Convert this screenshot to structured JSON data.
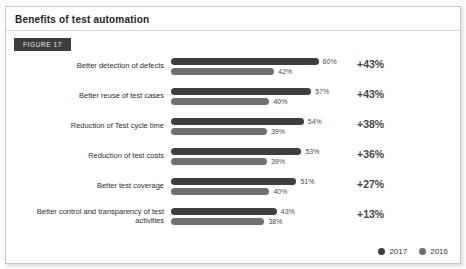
{
  "header": {
    "title": "Benefits of test automation",
    "figure_label": "FIGURE 17"
  },
  "chart_data": {
    "type": "bar",
    "orientation": "horizontal",
    "title": "Benefits of test automation",
    "unit": "%",
    "xlim": [
      0,
      65
    ],
    "grid": false,
    "legend_position": "bottom-right",
    "categories": [
      "Better detection of defects",
      "Better reuse of test cases",
      "Reduction of Test cycle time",
      "Reduction of test costs",
      "Better test coverage",
      "Better control and transparency of test activities"
    ],
    "series": [
      {
        "name": "2017",
        "color": "#3e3e3e",
        "values": [
          60,
          57,
          54,
          53,
          51,
          43
        ]
      },
      {
        "name": "2016",
        "color": "#6f6f6f",
        "values": [
          42,
          40,
          39,
          39,
          40,
          38
        ]
      }
    ],
    "change_labels": [
      "+43%",
      "+43%",
      "+38%",
      "+36%",
      "+27%",
      "+13%"
    ]
  },
  "rows": [
    {
      "v2017": "60%",
      "v2016": "42%",
      "change": "+43%"
    },
    {
      "v2017": "57%",
      "v2016": "40%",
      "change": "+43%"
    },
    {
      "v2017": "54%",
      "v2016": "39%",
      "change": "+38%"
    },
    {
      "v2017": "53%",
      "v2016": "39%",
      "change": "+36%"
    },
    {
      "v2017": "51%",
      "v2016": "40%",
      "change": "+27%"
    },
    {
      "v2017": "43%",
      "v2016": "38%",
      "change": "+13%"
    }
  ],
  "legend": {
    "items": [
      {
        "label": "2017",
        "color": "#3e3e3e"
      },
      {
        "label": "2016",
        "color": "#6f6f6f"
      }
    ]
  },
  "colors": {
    "bar_2017": "#3e3e3e",
    "bar_2016": "#6f6f6f",
    "badge_bg": "#3d3d3d",
    "card_border": "#c6c6c3"
  }
}
